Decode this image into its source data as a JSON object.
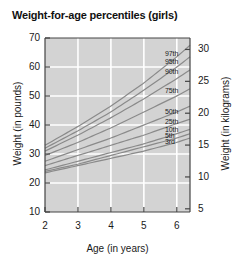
{
  "chart_data": {
    "type": "line",
    "title": "Weight-for-age percentiles (girls)",
    "xlabel": "Age (in years)",
    "ylabel": "Weight (in pounds)",
    "ylabel_secondary": "Weight (in kilograms)",
    "xlim": [
      2,
      6.4
    ],
    "ylim": [
      10,
      70
    ],
    "ylim_secondary": [
      4.5,
      31.8
    ],
    "xticks": [
      2,
      3,
      4,
      5,
      6
    ],
    "xticklabels": [
      "2",
      "3",
      "4",
      "5",
      "6"
    ],
    "yticks": [
      10,
      20,
      30,
      40,
      50,
      60,
      70
    ],
    "yticklabels": [
      "10",
      "20",
      "30",
      "40",
      "50",
      "60",
      "70"
    ],
    "yticks_secondary": [
      5,
      10,
      15,
      20,
      25,
      30
    ],
    "yticklabels_secondary": [
      "5",
      "10",
      "15",
      "20",
      "25",
      "30"
    ],
    "grid": true,
    "legend": "inline-right-end-labels",
    "x": [
      2,
      3,
      4,
      5,
      6,
      6.4
    ],
    "series": [
      {
        "name": "97th",
        "label": "97th",
        "values": [
          33.0,
          39.5,
          46.5,
          54.5,
          63.5,
          67.5
        ]
      },
      {
        "name": "95th",
        "label": "95th",
        "values": [
          32.0,
          38.0,
          44.5,
          52.0,
          60.0,
          63.5
        ]
      },
      {
        "name": "90th",
        "label": "90th",
        "values": [
          31.0,
          36.5,
          42.5,
          49.0,
          56.0,
          59.0
        ]
      },
      {
        "name": "75th",
        "label": "75th",
        "values": [
          29.5,
          34.0,
          39.0,
          44.5,
          50.0,
          52.5
        ]
      },
      {
        "name": "50th",
        "label": "50th",
        "values": [
          27.5,
          31.5,
          35.5,
          40.0,
          44.5,
          46.5
        ]
      },
      {
        "name": "25th",
        "label": "25th",
        "values": [
          26.0,
          29.5,
          33.0,
          36.5,
          40.5,
          42.0
        ]
      },
      {
        "name": "10th",
        "label": "10th",
        "values": [
          24.5,
          27.5,
          30.5,
          33.5,
          37.0,
          38.5
        ]
      },
      {
        "name": "5th",
        "label": "5th",
        "values": [
          24.0,
          26.5,
          29.5,
          32.5,
          35.5,
          37.0
        ]
      },
      {
        "name": "3rd",
        "label": "3rd",
        "values": [
          23.5,
          26.0,
          28.5,
          31.0,
          34.0,
          35.5
        ]
      }
    ],
    "colors": {
      "plot_background": "#d3d3d3",
      "gridline": "#ffffff",
      "curve": "#8a8a8a",
      "axis": "#444444",
      "text": "#1a1a1a",
      "page_background": "#ffffff"
    }
  }
}
